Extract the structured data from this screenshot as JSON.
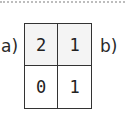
{
  "labels": {
    "left": "a)",
    "right": "b)"
  },
  "grid": {
    "rows": [
      [
        "2",
        "1"
      ],
      [
        "0",
        "1"
      ]
    ],
    "header_row_bg": "#f4f4f4"
  }
}
